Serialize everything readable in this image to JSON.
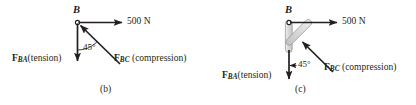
{
  "figure": {
    "type": "free-body-diagram-pair",
    "panels": [
      {
        "id": "b",
        "caption": "(b)",
        "joint_label": "B",
        "applied_load": "500 N",
        "angle_label": "45°",
        "forces": [
          {
            "name": "F_BA",
            "symbol": "F",
            "subscript": "BA",
            "qualifier": "(tension)",
            "direction": "down"
          },
          {
            "name": "F_BC",
            "symbol": "F",
            "subscript": "BC",
            "qualifier": "(compression)",
            "direction": "up-left-45"
          },
          {
            "name": "applied",
            "symbol": "",
            "subscript": "",
            "qualifier": "500 N",
            "direction": "right"
          }
        ],
        "members_shaded": false
      },
      {
        "id": "c",
        "caption": "(c)",
        "joint_label": "B",
        "applied_load": "500 N",
        "angle_label": "45°",
        "forces": [
          {
            "name": "F_BA",
            "symbol": "F",
            "subscript": "BA",
            "qualifier": "(tension)",
            "direction": "down"
          },
          {
            "name": "F_BC",
            "symbol": "F",
            "subscript": "BC",
            "qualifier": "(compression)",
            "direction": "up-left-45"
          },
          {
            "name": "applied",
            "symbol": "",
            "subscript": "",
            "qualifier": "500 N",
            "direction": "right"
          }
        ],
        "members_shaded": true
      }
    ],
    "colors": {
      "line": "#231f20",
      "member_fill": "#d9d9d9",
      "member_stroke": "#8c8c8c",
      "background": "#ffffff"
    }
  }
}
